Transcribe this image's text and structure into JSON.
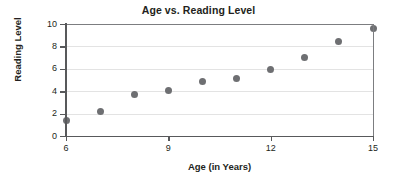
{
  "chart_data": {
    "type": "scatter",
    "title": "Age vs. Reading Level",
    "xlabel": "Age (in Years)",
    "ylabel": "Reading Level",
    "xlim": [
      6,
      15
    ],
    "ylim": [
      0,
      10
    ],
    "grid": true,
    "legend": "none",
    "marker_color": "#6e6f72",
    "x": [
      6,
      7,
      8,
      9,
      10,
      11,
      12,
      13,
      14,
      15
    ],
    "y": [
      1.35,
      2.2,
      3.7,
      4.05,
      4.85,
      5.15,
      5.95,
      7.0,
      8.45,
      9.6
    ],
    "points": [
      {
        "x": 6,
        "y": 1.35
      },
      {
        "x": 7,
        "y": 2.2
      },
      {
        "x": 8,
        "y": 3.7
      },
      {
        "x": 9,
        "y": 4.05
      },
      {
        "x": 10,
        "y": 4.85
      },
      {
        "x": 11,
        "y": 5.15
      },
      {
        "x": 12,
        "y": 5.95
      },
      {
        "x": 13,
        "y": 7.0
      },
      {
        "x": 14,
        "y": 8.45
      },
      {
        "x": 15,
        "y": 9.6
      }
    ],
    "xticks": [
      6,
      9,
      12,
      15
    ],
    "xtick_labels": [
      "6",
      "9",
      "12",
      "15"
    ],
    "yticks": [
      0,
      2,
      4,
      6,
      8,
      10
    ],
    "ytick_labels": [
      "0",
      "2",
      "4",
      "6",
      "8",
      "10"
    ],
    "gridlines_y": [
      2,
      4,
      6,
      8,
      10
    ]
  }
}
